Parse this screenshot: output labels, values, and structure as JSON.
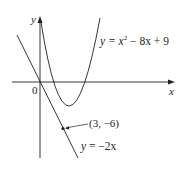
{
  "diagram": {
    "axes": {
      "x_label": "x",
      "y_label": "y",
      "origin_label": "0"
    },
    "curves": [
      {
        "name": "parabola",
        "label": "y = x² − 8x + 9",
        "equation": "y = x^2 - 8x + 9"
      },
      {
        "name": "tangent-line",
        "label": "y = −2x",
        "equation": "y = -2x"
      }
    ],
    "point": {
      "label": "(3, −6)",
      "x": 3,
      "y": -6
    },
    "labels": {
      "parabola_y": "y",
      "parabola_eq": " = x",
      "parabola_sup": "2",
      "parabola_rest": " − 8x + 9",
      "tangent_y": "y",
      "tangent_rest": " = −2x",
      "point": "(3, −6)"
    },
    "colors": {
      "stroke": "#231f20",
      "background": "#ffffff"
    }
  }
}
